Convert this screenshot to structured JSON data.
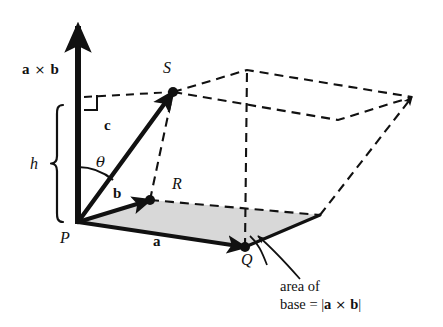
{
  "figure": {
    "background_color": "#ffffff",
    "ink_color": "#111111",
    "base_fill_color": "#d8d8d8"
  },
  "labels": {
    "cross_vector": "a × b",
    "cross_vector_a": "a",
    "cross_vector_cross": "×",
    "cross_vector_b": "b",
    "height": "h",
    "theta": "θ",
    "vector_a": "a",
    "vector_b": "b",
    "vector_c": "c",
    "point_p": "P",
    "point_q": "Q",
    "point_r": "R",
    "point_s": "S"
  },
  "caption": {
    "line1": "area of",
    "line2_prefix": "base = |",
    "line2_a": "a",
    "line2_cross": "×",
    "line2_b": "b",
    "line2_suffix": "|"
  },
  "geometry": {
    "origin_p": [
      78,
      222
    ],
    "point_r": [
      150,
      200
    ],
    "point_q": [
      245,
      247
    ],
    "point_s": [
      173,
      92
    ],
    "base_far_vertex": [
      320,
      215
    ],
    "top_back_vertex": [
      247,
      70
    ],
    "top_far_vertex": [
      412,
      97
    ],
    "axis_top": [
      78,
      22
    ],
    "height_top": [
      78,
      105
    ],
    "brace_top_y": 105,
    "brace_bottom_y": 222
  }
}
